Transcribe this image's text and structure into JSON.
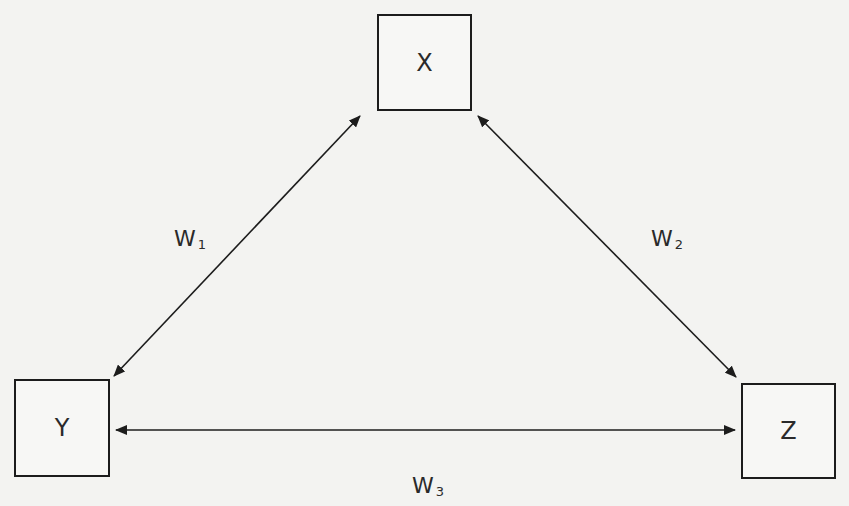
{
  "diagram": {
    "type": "triangle-network",
    "nodes": [
      {
        "id": "X",
        "label": "X",
        "position": "top-center"
      },
      {
        "id": "Y",
        "label": "Y",
        "position": "bottom-left"
      },
      {
        "id": "Z",
        "label": "Z",
        "position": "bottom-right"
      }
    ],
    "edges": [
      {
        "id": "w1",
        "from": "X",
        "to": "Y",
        "direction": "bidirectional",
        "label": "W",
        "subscript": "1"
      },
      {
        "id": "w2",
        "from": "X",
        "to": "Z",
        "direction": "bidirectional",
        "label": "W",
        "subscript": "2"
      },
      {
        "id": "w3",
        "from": "Y",
        "to": "Z",
        "direction": "bidirectional",
        "label": "W",
        "subscript": "3"
      }
    ]
  },
  "colors": {
    "background": "#f3f3f1",
    "stroke": "#1c1c1c",
    "text": "#2a2a2a"
  }
}
